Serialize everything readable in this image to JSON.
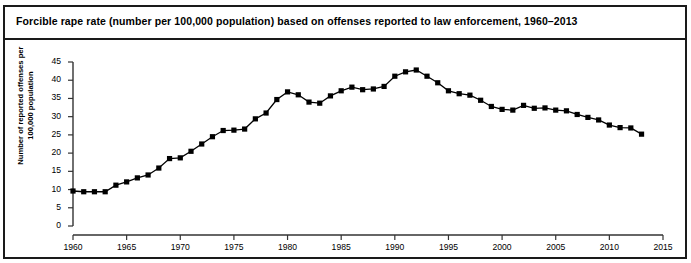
{
  "figure": {
    "title": "Forcible rape rate (number per 100,000 population) based on offenses reported to law enforcement, 1960–2013",
    "border_color": "#1a1a1a",
    "background": "#ffffff"
  },
  "chart_data": {
    "type": "line",
    "title": "Forcible rape rate (number per 100,000 population) based on offenses reported to law enforcement, 1960–2013",
    "xlabel": "",
    "ylabel": "Number of reported offenses per 100,000 population",
    "xlim": [
      1960,
      2015
    ],
    "ylim": [
      0,
      45
    ],
    "xticks": [
      1960,
      1965,
      1970,
      1975,
      1980,
      1985,
      1990,
      1995,
      2000,
      2005,
      2010,
      2015
    ],
    "xtick_labels": [
      "1960",
      "1965",
      "1970",
      "1975",
      "1980",
      "1985",
      "1990",
      "1995",
      "2000",
      "2005",
      "2010",
      "2015"
    ],
    "yticks": [
      0,
      5,
      10,
      15,
      20,
      25,
      30,
      35,
      40,
      45
    ],
    "ytick_labels": [
      "0",
      "5",
      "10",
      "15",
      "20",
      "25",
      "30",
      "35",
      "40",
      "45"
    ],
    "grid": false,
    "legend": false,
    "marker": "square",
    "marker_color": "#000000",
    "line_color": "#000000",
    "x": [
      1960,
      1961,
      1962,
      1963,
      1964,
      1965,
      1966,
      1967,
      1968,
      1969,
      1970,
      1971,
      1972,
      1973,
      1974,
      1975,
      1976,
      1977,
      1978,
      1979,
      1980,
      1981,
      1982,
      1983,
      1984,
      1985,
      1986,
      1987,
      1988,
      1989,
      1990,
      1991,
      1992,
      1993,
      1994,
      1995,
      1996,
      1997,
      1998,
      1999,
      2000,
      2001,
      2002,
      2003,
      2004,
      2005,
      2006,
      2007,
      2008,
      2009,
      2010,
      2011,
      2012,
      2013
    ],
    "values": [
      9.6,
      9.4,
      9.4,
      9.4,
      11.2,
      12.1,
      13.2,
      14.0,
      15.9,
      18.5,
      18.7,
      20.5,
      22.5,
      24.5,
      26.2,
      26.3,
      26.6,
      29.4,
      31.0,
      34.7,
      36.8,
      36.0,
      34.0,
      33.7,
      35.7,
      37.1,
      38.1,
      37.4,
      37.6,
      38.3,
      41.1,
      42.3,
      42.8,
      41.1,
      39.3,
      37.1,
      36.3,
      35.9,
      34.5,
      32.8,
      32.0,
      31.8,
      33.1,
      32.3,
      32.4,
      31.8,
      31.6,
      30.6,
      29.8,
      29.1,
      27.7,
      27.0,
      26.9,
      25.2
    ]
  }
}
